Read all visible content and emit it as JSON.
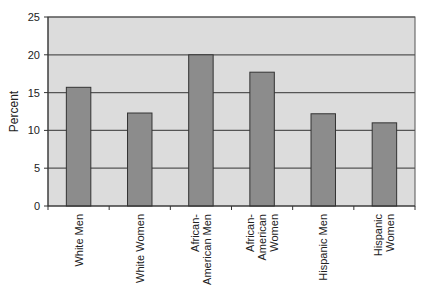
{
  "chart_data": {
    "type": "bar",
    "title": "",
    "xlabel": "",
    "ylabel": "Percent",
    "ylim": [
      0,
      25
    ],
    "yticks": [
      0,
      5,
      10,
      15,
      20,
      25
    ],
    "grid": true,
    "legend": "none",
    "categories": [
      [
        "White Men"
      ],
      [
        "White Women"
      ],
      [
        "African-",
        "American Men"
      ],
      [
        "African-",
        "American",
        "Women"
      ],
      [
        "Hispanic Men"
      ],
      [
        "Hispanic",
        "Women"
      ]
    ],
    "category_names": [
      "White Men",
      "White Women",
      "African-American Men",
      "African-American Women",
      "Hispanic Men",
      "Hispanic Women"
    ],
    "values": [
      15.7,
      12.3,
      20.0,
      17.7,
      12.2,
      11.0
    ],
    "colors": {
      "plot_background": "#dcdcdc",
      "bar_fill": "#8c8c8c",
      "bar_stroke": "#333333",
      "gridline": "#555555"
    }
  }
}
